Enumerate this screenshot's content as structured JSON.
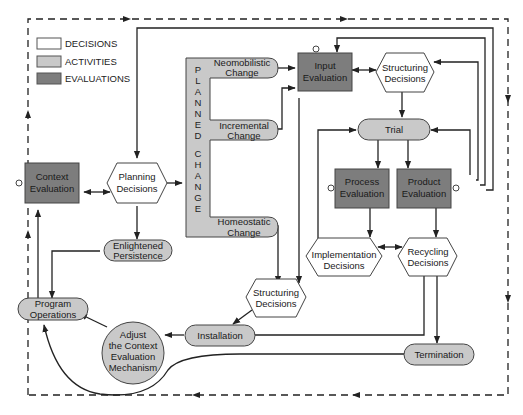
{
  "legend": {
    "items": [
      {
        "label": "DECISIONS",
        "color": "#ffffff"
      },
      {
        "label": "ACTIVITIES",
        "color": "#c9c9c9"
      },
      {
        "label": "EVALUATIONS",
        "color": "#7d7d7d"
      }
    ]
  },
  "colors": {
    "decision_fill": "#ffffff",
    "activity_fill": "#c9c9c9",
    "evaluation_fill": "#7d7d7d",
    "stroke": "#333333"
  },
  "nodes": {
    "context_evaluation": {
      "line1": "Context",
      "line2": "Evaluation",
      "type": "evaluation"
    },
    "planning_decisions": {
      "line1": "Planning",
      "line2": "Decisions",
      "type": "decision"
    },
    "planned_change": {
      "vertical_label": [
        "P",
        "L",
        "A",
        "N",
        "N",
        "E",
        "D",
        "",
        "C",
        "H",
        "A",
        "N",
        "G",
        "E"
      ],
      "type": "activity"
    },
    "neomobilistic_change": {
      "line1": "Neomobilistic",
      "line2": "Change",
      "type": "activity"
    },
    "incremental_change": {
      "line1": "Incremental",
      "line2": "Change",
      "type": "activity"
    },
    "homeostatic_change": {
      "line1": "Homeostatic",
      "line2": "Change",
      "type": "activity"
    },
    "input_evaluation": {
      "line1": "Input",
      "line2": "Evaluation",
      "type": "evaluation"
    },
    "structuring_decisions_top": {
      "line1": "Structuring",
      "line2": "Decisions",
      "type": "decision"
    },
    "trial": {
      "line1": "Trial",
      "type": "activity"
    },
    "process_evaluation": {
      "line1": "Process",
      "line2": "Evaluation",
      "type": "evaluation"
    },
    "product_evaluation": {
      "line1": "Product",
      "line2": "Evaluation",
      "type": "evaluation"
    },
    "implementation_decisions": {
      "line1": "Implementation",
      "line2": "Decisions",
      "type": "decision"
    },
    "recycling_decisions": {
      "line1": "Recycling",
      "line2": "Decisions",
      "type": "decision"
    },
    "enlightened_persistence": {
      "line1": "Enlightened",
      "line2": "Persistence",
      "type": "activity"
    },
    "structuring_decisions_bottom": {
      "line1": "Structuring",
      "line2": "Decisions",
      "type": "decision"
    },
    "program_operations": {
      "line1": "Program",
      "line2": "Operations",
      "type": "activity"
    },
    "installation": {
      "line1": "Installation",
      "type": "activity"
    },
    "adjust_mechanism": {
      "line1": "Adjust",
      "line2": "the Context",
      "line3": "Evaluation",
      "line4": "Mechanism",
      "type": "activity"
    },
    "termination": {
      "line1": "Termination",
      "type": "activity"
    }
  }
}
